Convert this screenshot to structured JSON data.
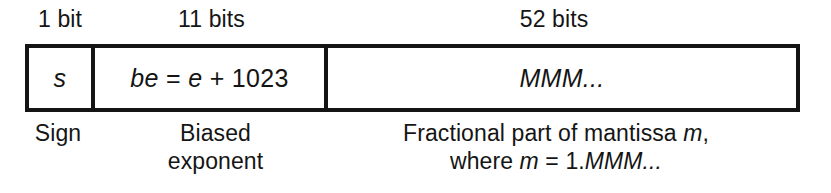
{
  "figure": {
    "ink_color": "#141414",
    "background_color": "#ffffff"
  },
  "top_labels": {
    "sign": "1 bit",
    "exponent": "11 bits",
    "mantissa": "52 bits"
  },
  "fields": [
    {
      "name": "sign",
      "cell_text": "s",
      "caption_line1": "Sign",
      "caption_line2": ""
    },
    {
      "name": "biased-exponent",
      "cell_text_part1": "be",
      "cell_text_part2": " = ",
      "cell_text_part3": "e",
      "cell_text_part4": " + 1023",
      "caption_line1": "Biased",
      "caption_line2": "exponent"
    },
    {
      "name": "mantissa",
      "cell_text": "MMM...",
      "caption_line1_part1": "Fractional part of mantissa ",
      "caption_line1_part2": "m",
      "caption_line1_part3": ",",
      "caption_line2_part1": "where ",
      "caption_line2_part2": "m",
      "caption_line2_part3": " = 1.",
      "caption_line2_part4": "MMM...",
      "caption_line2_part5": ""
    }
  ]
}
